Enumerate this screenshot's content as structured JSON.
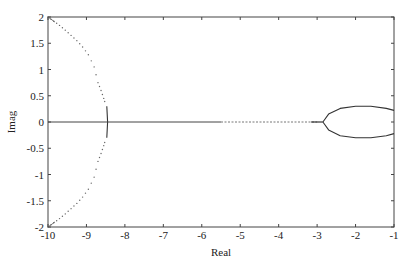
{
  "chart_data": {
    "type": "scatter",
    "title": "",
    "xlabel": "Real",
    "ylabel": "Imag",
    "xlim": [
      -10,
      -1
    ],
    "ylim": [
      -2,
      2
    ],
    "grid": false,
    "legend": null,
    "x_ticks": [
      -10,
      -9,
      -8,
      -7,
      -6,
      -5,
      -4,
      -3,
      -2,
      -1
    ],
    "x_tick_labels": [
      "-10",
      "-9",
      "-8",
      "-7",
      "-6",
      "-5",
      "-4",
      "-3",
      "-2",
      "-1"
    ],
    "y_ticks": [
      2,
      1.5,
      1,
      0.5,
      0,
      -0.5,
      -1,
      -1.5,
      -2
    ],
    "y_tick_labels": [
      "2",
      "1.5",
      "1",
      "0.5",
      "0",
      "-0.5",
      "-1",
      "-1.5",
      "-2"
    ],
    "series": [
      {
        "name": "upper-branch",
        "style": "dotted",
        "points": [
          [
            -10,
            2.0
          ],
          [
            -9.85,
            1.92
          ],
          [
            -9.7,
            1.84
          ],
          [
            -9.55,
            1.75
          ],
          [
            -9.4,
            1.65
          ],
          [
            -9.25,
            1.55
          ],
          [
            -9.1,
            1.43
          ],
          [
            -8.95,
            1.28
          ],
          [
            -8.8,
            1.05
          ],
          [
            -8.7,
            0.75
          ],
          [
            -8.62,
            0.6
          ],
          [
            -8.55,
            0.45
          ],
          [
            -8.5,
            0.33
          ]
        ]
      },
      {
        "name": "lower-branch",
        "style": "dotted",
        "points": [
          [
            -10,
            -2.0
          ],
          [
            -9.85,
            -1.92
          ],
          [
            -9.7,
            -1.84
          ],
          [
            -9.55,
            -1.75
          ],
          [
            -9.4,
            -1.65
          ],
          [
            -9.25,
            -1.55
          ],
          [
            -9.1,
            -1.43
          ],
          [
            -8.95,
            -1.28
          ],
          [
            -8.8,
            -1.05
          ],
          [
            -8.7,
            -0.75
          ],
          [
            -8.62,
            -0.6
          ],
          [
            -8.55,
            -0.45
          ],
          [
            -8.5,
            -0.33
          ]
        ]
      },
      {
        "name": "vertical-segment",
        "style": "solid",
        "points": [
          [
            -8.47,
            0.3
          ],
          [
            -8.45,
            0.0
          ],
          [
            -8.47,
            -0.3
          ]
        ]
      },
      {
        "name": "real-axis-locus",
        "style": "solid-then-dotted",
        "points": [
          [
            -10,
            0
          ],
          [
            -5.5,
            0
          ],
          [
            -3.0,
            0
          ],
          [
            -2.85,
            0
          ]
        ]
      },
      {
        "name": "loop-upper",
        "style": "solid",
        "points": [
          [
            -2.85,
            0.0
          ],
          [
            -2.7,
            0.15
          ],
          [
            -2.4,
            0.26
          ],
          [
            -2.0,
            0.3
          ],
          [
            -1.6,
            0.3
          ],
          [
            -1.2,
            0.26
          ],
          [
            -1.0,
            0.22
          ]
        ]
      },
      {
        "name": "loop-lower",
        "style": "solid",
        "points": [
          [
            -2.85,
            0.0
          ],
          [
            -2.7,
            -0.15
          ],
          [
            -2.4,
            -0.26
          ],
          [
            -2.0,
            -0.3
          ],
          [
            -1.6,
            -0.3
          ],
          [
            -1.2,
            -0.26
          ],
          [
            -1.0,
            -0.22
          ]
        ]
      }
    ]
  }
}
